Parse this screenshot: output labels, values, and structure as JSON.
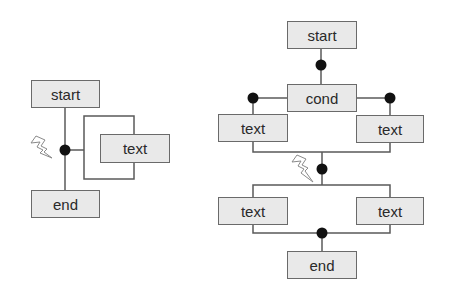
{
  "diagram": {
    "left": {
      "start": "start",
      "loop_body": "text",
      "end": "end"
    },
    "right": {
      "start": "start",
      "condition": "cond",
      "branch_left": "text",
      "branch_right": "text",
      "parallel_left": "text",
      "parallel_right": "text",
      "end": "end"
    }
  },
  "colors": {
    "box_fill": "#e9e9e9",
    "box_border": "#6a6a6a",
    "line": "#5a5a5a",
    "dot": "#111111"
  }
}
